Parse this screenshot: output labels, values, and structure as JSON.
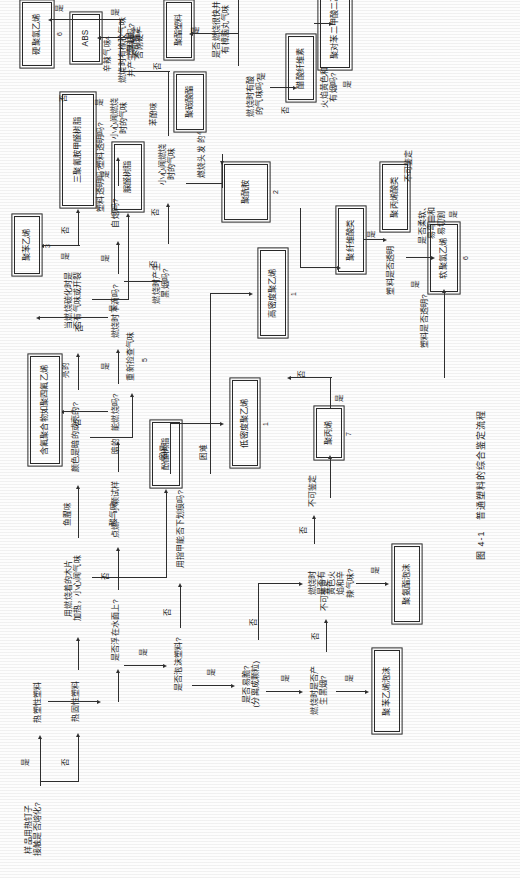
{
  "caption": "图 4-1   普通塑料的综合鉴定流程",
  "figure_title": "普通塑料的综合鉴定流程",
  "questions": {
    "q_start": "样品用热钉子\n接触是否熔化?",
    "q_float": "是否浮在水面上?",
    "q_foam": "是否泡沫塑料?",
    "q_brittle": "是否易脆?\n(分离成颗粒)",
    "q_scratch": "用指甲能否下划痕吗?",
    "q_blacksmoke_foam": "燃烧时是否产\n生黑烟?",
    "q_yellowflame_foam": "燃烧时\n是否有\n黄色火\n焰和辛\n辣气味?",
    "q_burn": "能燃烧吗?",
    "q_drip": "燃烧时下滴吗?",
    "q_selfext": "自熄吗?",
    "q_blacksmoke": "燃烧时产生\n黑烟吗?",
    "q_careful_smell": "小心闻燃烧\n时的气味",
    "q_burnhead": "燃烧头发\n的气味",
    "q_transparent1": "塑料透明吗?",
    "q_transparent2": "塑料透明吗?",
    "q_transparent3": "塑料是否透明",
    "q_transparent4": "塑料是否透明?",
    "q_hard": "塑料是\n否刚硬?",
    "q_soft_bend": "是否柔软、\n易弯曲和\n易切割",
    "q_rubber_smoke": "燃烧时有橡胶气味\n并产生黑烟吗?",
    "q_acid_smell": "燃烧时有酸\n的气味吗?",
    "q_fast_camphor": "是否燃烧很快并\n有樟脑丸气味",
    "q_yellow_smoke": "火焰黄色和\n有烟吗?",
    "q_thermoset_wood": "用燃烧着的木片\n加热，小心闻气味",
    "q_color_dark": "颜色是暗的或亮的?",
    "q_carbon_crack": "当燃烧碳化时是\n否有气味或开裂",
    "q_ignite_small": "点燃一小颗试样"
  },
  "answers": {
    "yes": "是",
    "no": "否",
    "easy": "容易",
    "hard": "困难",
    "dark": "暗的",
    "bright": "亮的",
    "fish": "鱼腥味",
    "acid": "酸气味",
    "phenol": "苯酚味",
    "freshfish": "重新捡查气味",
    "spicy": "辛辣气味"
  },
  "results": {
    "thermoplastic": "热塑性塑料",
    "thermoset": "热固性塑料",
    "ps_foam": "聚苯乙烯泡沫",
    "pu_foam": "聚氨酯泡沫",
    "hdpe": "高密度聚乙烯",
    "ldpe": "低密度聚乙烯",
    "pp": "聚丙烯",
    "fluoro": "含氟聚合物如聚四氟乙烯",
    "ps": "聚苯乙烯",
    "pa": "聚酰胺",
    "pvc_hard": "硬聚氯乙烯",
    "pvc_soft": "软聚氯乙烯",
    "pc": "聚碳酸酯",
    "abs": "ABS",
    "acrylic": "聚丙烯酸类",
    "cellulose_group": "聚纤维酸类",
    "cellulose_acetate": "醋酸纤维素",
    "polyester": "聚酯塑料",
    "pet": "聚对苯二甲酸二乙酯",
    "melamine": "三聚氰胺甲醛树脂",
    "urea": "脲醛树脂",
    "phenolic": "酚醛树脂",
    "unidentifiable": "不可鉴定"
  },
  "numbers": {
    "hdpe": "1",
    "ldpe": "1",
    "pa": "2",
    "ps": "3",
    "abs": "4",
    "phenolic": "5",
    "pvc_hard": "6",
    "pvc_soft": "6",
    "pp": "7"
  },
  "colors": {
    "line": "#2f2f2f",
    "box_border": "#2a2a2a",
    "paper": "#fdfdfd",
    "text": "#1b1b1b"
  }
}
